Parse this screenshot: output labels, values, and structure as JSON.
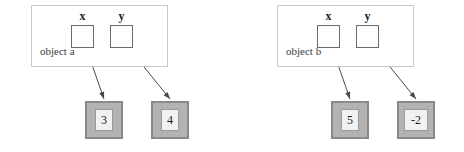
{
  "diagram": {
    "type": "object-reference-diagram",
    "groups": [
      {
        "id": "group-a",
        "object_label": "object a",
        "box": {
          "x": 31,
          "y": 5,
          "width": 137,
          "height": 62
        },
        "variables": [
          {
            "name": "x",
            "label": "x",
            "slot": {
              "x": 71,
              "y": 25,
              "width": 23,
              "height": 23
            },
            "label_pos": {
              "x": 71,
              "y": 10,
              "width": 23
            },
            "arrow": {
              "x1": 82,
              "y1": 36,
              "x2": 104,
              "y2": 99
            },
            "value": "3"
          },
          {
            "name": "y",
            "label": "y",
            "slot": {
              "x": 110,
              "y": 25,
              "width": 23,
              "height": 23
            },
            "label_pos": {
              "x": 110,
              "y": 10,
              "width": 23
            },
            "arrow": {
              "x1": 119,
              "y1": 36,
              "x2": 170,
              "y2": 99
            },
            "value": "4"
          }
        ],
        "values": [
          {
            "text": "3",
            "box": {
              "x": 85,
              "y": 101,
              "width": 38,
              "height": 38
            },
            "wide": false
          },
          {
            "text": "4",
            "box": {
              "x": 151,
              "y": 101,
              "width": 38,
              "height": 38
            },
            "wide": false
          }
        ]
      },
      {
        "id": "group-b",
        "object_label": "object b",
        "box": {
          "x": 277,
          "y": 5,
          "width": 137,
          "height": 62
        },
        "variables": [
          {
            "name": "x",
            "label": "x",
            "slot": {
              "x": 317,
              "y": 25,
              "width": 23,
              "height": 23
            },
            "label_pos": {
              "x": 317,
              "y": 10,
              "width": 23
            },
            "arrow": {
              "x1": 328,
              "y1": 36,
              "x2": 350,
              "y2": 99
            },
            "value": "5"
          },
          {
            "name": "y",
            "label": "y",
            "slot": {
              "x": 356,
              "y": 25,
              "width": 23,
              "height": 23
            },
            "label_pos": {
              "x": 356,
              "y": 10,
              "width": 23
            },
            "arrow": {
              "x1": 365,
              "y1": 36,
              "x2": 416,
              "y2": 99
            },
            "value": "-2"
          }
        ],
        "values": [
          {
            "text": "5",
            "box": {
              "x": 331,
              "y": 101,
              "width": 38,
              "height": 38
            },
            "wide": false
          },
          {
            "text": "-2",
            "box": {
              "x": 397,
              "y": 101,
              "width": 38,
              "height": 38
            },
            "wide": true
          }
        ]
      }
    ],
    "colors": {
      "object_box_border": "#c9c9c9",
      "var_slot_border": "#6b6b6b",
      "value_box_fill": "#b3b3b3",
      "value_box_border": "#8a8a8a",
      "value_inner_fill": "#f2f2f2",
      "value_inner_border": "#9a9a9a",
      "arrow": "#4a4a4a",
      "text": "#1c1c1c",
      "object_label_text": "#3a3a3a",
      "background": "#ffffff"
    }
  }
}
